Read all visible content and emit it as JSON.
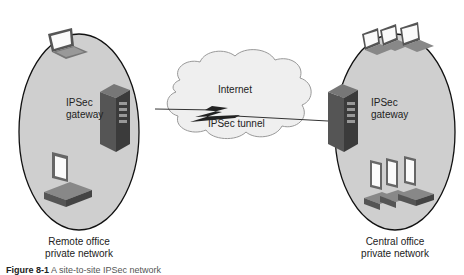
{
  "diagram": {
    "nodes": {
      "remote_gateway": {
        "label_line1": "IPSec",
        "label_line2": "gateway"
      },
      "central_gateway": {
        "label_line1": "IPSec",
        "label_line2": "gateway"
      },
      "internet": {
        "label": "Internet"
      },
      "tunnel": {
        "label": "IPSec tunnel"
      }
    },
    "networks": {
      "remote": {
        "line1": "Remote office",
        "line2": "private network"
      },
      "central": {
        "line1": "Central office",
        "line2": "private network"
      }
    },
    "caption": {
      "prefix": "Figure 8-1",
      "text": "A site-to-site IPSec network"
    },
    "colors": {
      "network_fill": "#cfcfcf",
      "cloud_fill": "#f0f0f0",
      "server": "#4a4a4a",
      "text": "#222222"
    }
  }
}
